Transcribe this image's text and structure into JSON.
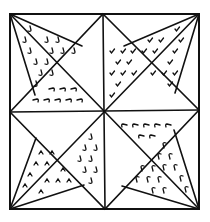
{
  "figure": {
    "pattern": "eight-pointed star",
    "colors": {
      "ink": "#111111",
      "background": "#ffffff"
    },
    "shaded_regions": [
      {
        "name": "upper-left-star-point-a",
        "mark": "hook-down"
      },
      {
        "name": "upper-left-star-point-b",
        "mark": "hook-right"
      },
      {
        "name": "upper-right-star-point-a",
        "mark": "check"
      },
      {
        "name": "upper-right-star-point-b",
        "mark": "check"
      },
      {
        "name": "lower-left-star-point-a",
        "mark": "caret-up"
      },
      {
        "name": "lower-left-star-point-b",
        "mark": "hook-up"
      },
      {
        "name": "lower-right-star-point-a",
        "mark": "hook-left"
      },
      {
        "name": "lower-right-star-point-b",
        "mark": "hook-up"
      }
    ]
  }
}
